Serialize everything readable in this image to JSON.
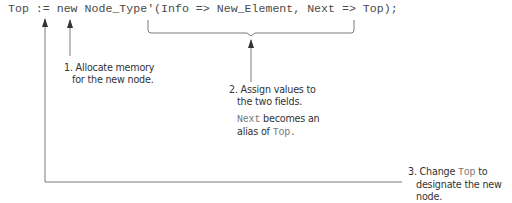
{
  "code": {
    "statement": "Top := new Node_Type'(Info => New_Element, Next => Top);"
  },
  "annotations": {
    "step1": {
      "line1": "1. Allocate memory",
      "line2": "for the new node."
    },
    "step2": {
      "line1": "2. Assign values to",
      "line2": "the two fields.",
      "note_mono1": "Next",
      "note_text1": " becomes an",
      "note_text2": "alias of ",
      "note_mono2": "Top."
    },
    "step3": {
      "line1_pre": "3. Change ",
      "line1_mono": "Top",
      "line1_post": " to",
      "line2": "designate the new",
      "line3": "node."
    }
  },
  "colors": {
    "lines": "#7a7a7a",
    "arrowheads": "#333333",
    "text": "#333333",
    "code": "#4a4a4a"
  }
}
